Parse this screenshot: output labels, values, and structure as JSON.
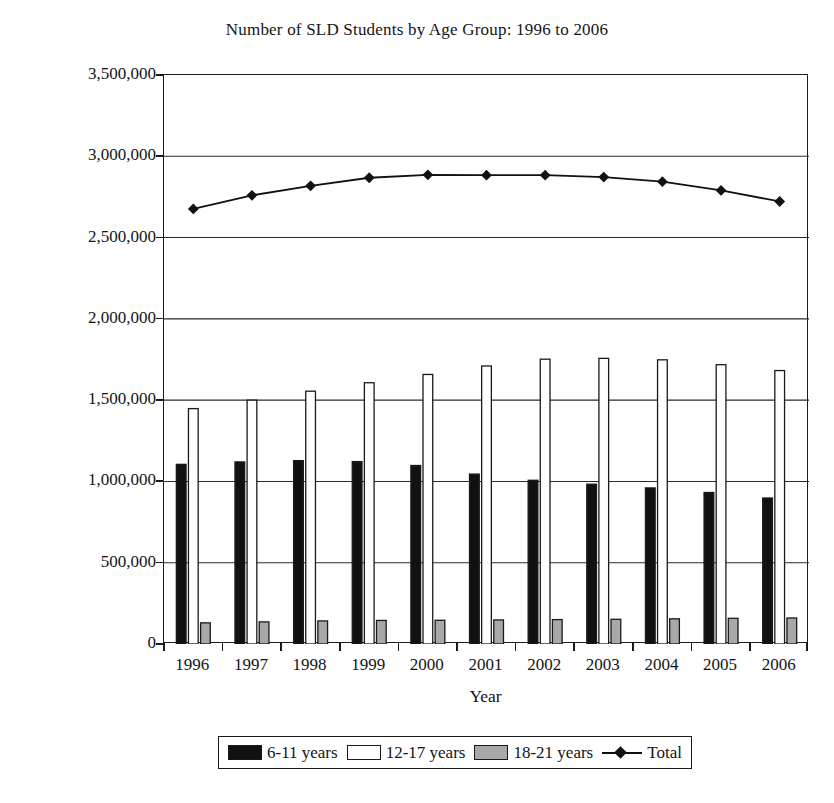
{
  "chart_data": {
    "type": "bar",
    "title": "Number of SLD Students by Age Group: 1996 to 2006",
    "xlabel": "Year",
    "ylabel": "Number of SLD Students",
    "categories": [
      "1996",
      "1997",
      "1998",
      "1999",
      "2000",
      "2001",
      "2002",
      "2003",
      "2004",
      "2005",
      "2006"
    ],
    "ylim": [
      0,
      3500000
    ],
    "ytick_labels": [
      "0",
      "500,000",
      "1,000,000",
      "1,500,000",
      "2,000,000",
      "2,500,000",
      "3,000,000",
      "3,500,000"
    ],
    "ytick_values": [
      0,
      500000,
      1000000,
      1500000,
      2000000,
      2500000,
      3000000,
      3500000
    ],
    "grid": "horizontal",
    "legend_position": "bottom",
    "series": [
      {
        "name": "6-11 years",
        "type": "bar",
        "color": "#111111",
        "values": [
          1105000,
          1120000,
          1128000,
          1122000,
          1098000,
          1045000,
          1007000,
          983000,
          960000,
          932000,
          898000
        ]
      },
      {
        "name": "12-17 years",
        "type": "bar",
        "color": "#ffffff",
        "values": [
          1448000,
          1500000,
          1555000,
          1607000,
          1658000,
          1710000,
          1752000,
          1757000,
          1748000,
          1718000,
          1682000
        ]
      },
      {
        "name": "18-21 years",
        "type": "bar",
        "color": "#a8a8a8",
        "values": [
          130000,
          136000,
          142000,
          145000,
          146000,
          148000,
          150000,
          152000,
          155000,
          158000,
          160000
        ]
      },
      {
        "name": "Total",
        "type": "line",
        "color": "#111111",
        "marker": "diamond",
        "values": [
          2676000,
          2760000,
          2818000,
          2868000,
          2886000,
          2884000,
          2884000,
          2872000,
          2844000,
          2790000,
          2722000
        ]
      }
    ]
  },
  "legend": {
    "items": [
      {
        "label": "6-11 years",
        "swatch": "black-swatch"
      },
      {
        "label": "12-17 years",
        "swatch": "white-swatch"
      },
      {
        "label": "18-21 years",
        "swatch": "gray-swatch"
      },
      {
        "label": "Total",
        "swatch": "line-diamond-marker"
      }
    ]
  }
}
